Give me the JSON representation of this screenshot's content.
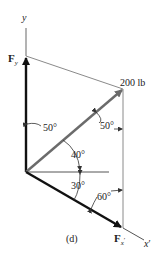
{
  "figure": {
    "caption": "(d)",
    "axes": {
      "y_label": "y",
      "x_label": "x",
      "x_prime": "′"
    },
    "force": {
      "magnitude_label": "200 lb",
      "magnitude": 200,
      "unit": "lb"
    },
    "components": {
      "fy": {
        "base": "F",
        "sub": "y"
      },
      "fx": {
        "base": "F",
        "sub": "x",
        "prime": "′"
      }
    },
    "angles": [
      {
        "id": "angle-force-to-fy",
        "label": "50°",
        "value": 50
      },
      {
        "id": "angle-vertical-to-force",
        "label": "50°",
        "value": 50
      },
      {
        "id": "angle-force-to-horizontal",
        "label": "40°",
        "value": 40
      },
      {
        "id": "angle-horizontal-to-xprime",
        "label": "30°",
        "value": 30
      },
      {
        "id": "angle-xprime-to-vertical",
        "label": "60°",
        "value": 60
      }
    ],
    "colors": {
      "force_arrow": "#6b6b6b",
      "component_arrow": "#111111",
      "construction_line": "#8a8a8a"
    }
  }
}
